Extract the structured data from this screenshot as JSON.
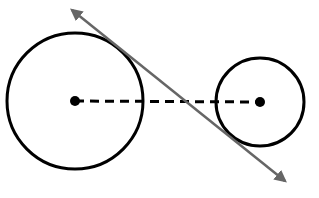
{
  "diagram": {
    "background": "#ffffff",
    "stroke_color": "#000000",
    "tangent_color": "#666666",
    "large_circle": {
      "cx": 75,
      "cy": 101,
      "r": 68
    },
    "small_circle": {
      "cx": 260,
      "cy": 102,
      "r": 44
    },
    "center_line": {
      "x1": 75,
      "y1": 101,
      "x2": 260,
      "y2": 102,
      "style": "dashed"
    },
    "tangent_line": {
      "x1": 70,
      "y1": 8,
      "x2": 287,
      "y2": 183,
      "arrows": "both"
    }
  }
}
